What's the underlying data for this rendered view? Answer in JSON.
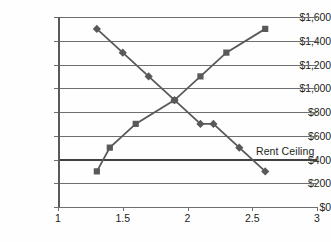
{
  "chart_data": {
    "type": "line",
    "title": "",
    "xlabel": "",
    "ylabel": "",
    "xlim": [
      1,
      3
    ],
    "ylim": [
      0,
      1600
    ],
    "grid": true,
    "legend_position": "none",
    "x_ticks": [
      "1",
      "1.5",
      "2",
      "2.5",
      "3"
    ],
    "x_tick_values": [
      1,
      1.5,
      2,
      2.5,
      3
    ],
    "y_ticks": [
      "$0",
      "$200",
      "$400",
      "$600",
      "$800",
      "$1,000",
      "$1,200",
      "$1,400",
      "$1,600"
    ],
    "y_tick_values": [
      0,
      200,
      400,
      600,
      800,
      1000,
      1200,
      1400,
      1600
    ],
    "series": [
      {
        "name": "Demand",
        "marker": "diamond",
        "color": "#58595b",
        "x": [
          1.3,
          1.5,
          1.7,
          1.9,
          2.1,
          2.2,
          2.4,
          2.6
        ],
        "values": [
          1500,
          1300,
          1100,
          900,
          700,
          700,
          500,
          300
        ]
      },
      {
        "name": "Supply",
        "marker": "square",
        "color": "#58595b",
        "x": [
          1.3,
          1.4,
          1.6,
          1.9,
          2.1,
          2.3,
          2.6
        ],
        "values": [
          300,
          500,
          700,
          900,
          1100,
          1300,
          1500
        ]
      }
    ],
    "annotations": [
      {
        "label": "Rent Ceiling",
        "type": "horizontal-line",
        "value": 400,
        "color": "#414042"
      }
    ]
  },
  "axis": {
    "y_labels": {
      "t0": "$0",
      "t200": "$200",
      "t400": "$400",
      "t600": "$600",
      "t800": "$800",
      "t1000": "$1,000",
      "t1200": "$1,200",
      "t1400": "$1,400",
      "t1600": "$1,600"
    },
    "x_labels": {
      "t1": "1",
      "t15": "1.5",
      "t2": "2",
      "t25": "2.5",
      "t3": "3"
    }
  },
  "annotation": {
    "rent_ceiling_label": "Rent Ceiling"
  }
}
